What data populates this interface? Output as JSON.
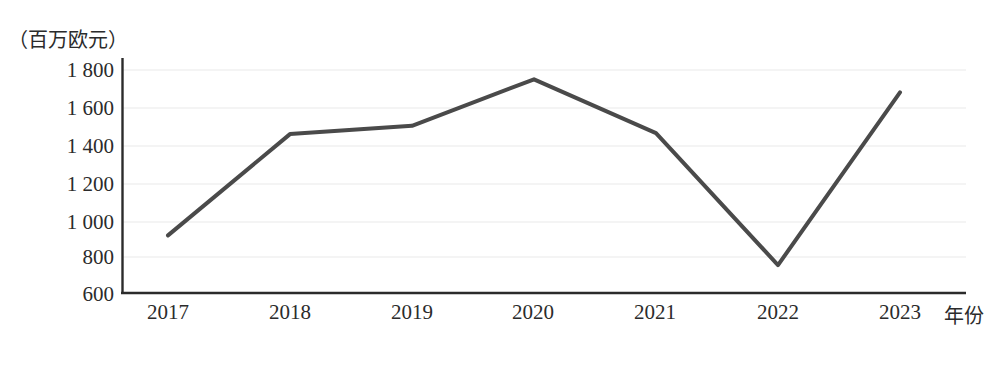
{
  "chart_data": {
    "type": "line",
    "title": "",
    "subtitle": "",
    "xlabel": "年份",
    "ylabel": "（百万欧元）",
    "unit_label": "（百万欧元）",
    "categories": [
      "2017",
      "2018",
      "2019",
      "2020",
      "2021",
      "2022",
      "2023"
    ],
    "x": [
      2017,
      2018,
      2019,
      2020,
      2021,
      2022,
      2023
    ],
    "values": [
      910,
      1455,
      1500,
      1750,
      1460,
      750,
      1680
    ],
    "series": [
      {
        "name": "",
        "values": [
          910,
          1455,
          1500,
          1750,
          1460,
          750,
          1680
        ]
      }
    ],
    "ylim": [
      600,
      1800
    ],
    "yticks": [
      600,
      800,
      1000,
      1200,
      1400,
      1600,
      1800
    ],
    "ytick_labels": [
      "600",
      "800",
      "1 000",
      "1 200",
      "1 400",
      "1 600",
      "1 800"
    ],
    "xtick_labels": [
      "2017",
      "2018",
      "2019",
      "2020",
      "2021",
      "2022",
      "2023"
    ],
    "grid": true,
    "grid_axis": "y",
    "legend": false,
    "legend_position": "none",
    "markers": false,
    "line_color": "#4a4a4a",
    "line_width": 4,
    "grid_color": "#e9e9e9",
    "axis_color": "#2b2b2b",
    "background_color": "#ffffff",
    "annotations": []
  },
  "axes": {
    "y_unit": "（百万欧元）",
    "x_title": "年份"
  }
}
